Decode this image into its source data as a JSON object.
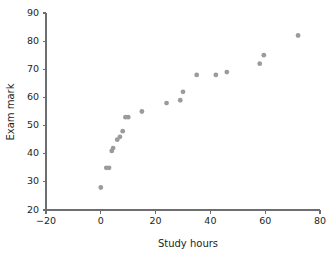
{
  "chart_data": {
    "type": "scatter",
    "title": "",
    "xlabel": "Study hours",
    "ylabel": "Exam mark",
    "xlim": [
      -20,
      80
    ],
    "ylim": [
      20,
      90
    ],
    "xticks": [
      -20,
      0,
      20,
      40,
      60,
      80
    ],
    "yticks": [
      20,
      30,
      40,
      50,
      60,
      70,
      80,
      90
    ],
    "xtick_labels": [
      "−20",
      "0",
      "20",
      "40",
      "60",
      "80"
    ],
    "ytick_labels": [
      "20",
      "30",
      "40",
      "50",
      "60",
      "70",
      "80",
      "90"
    ],
    "grid": false,
    "legend": null,
    "marker_color": "#9b9b9d",
    "axis_color": "#6d6e71",
    "series": [
      {
        "name": "students",
        "points": [
          [
            0,
            28
          ],
          [
            2,
            35
          ],
          [
            3,
            35
          ],
          [
            4,
            41
          ],
          [
            4.5,
            42
          ],
          [
            6,
            45
          ],
          [
            7,
            46
          ],
          [
            8,
            48
          ],
          [
            9,
            53
          ],
          [
            10,
            53
          ],
          [
            15,
            55
          ],
          [
            24,
            58
          ],
          [
            29,
            59
          ],
          [
            30,
            62
          ],
          [
            35,
            68
          ],
          [
            42,
            68
          ],
          [
            46,
            69
          ],
          [
            58,
            72
          ],
          [
            59.5,
            75
          ],
          [
            72,
            82
          ]
        ]
      }
    ]
  }
}
